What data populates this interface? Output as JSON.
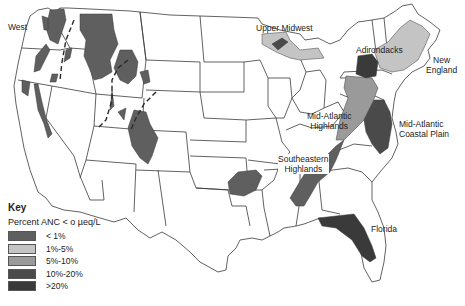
{
  "map": {
    "title": "Percent ANC < 0 µeq/L",
    "regions": [
      {
        "id": "west",
        "label": "West",
        "category": "<1%"
      },
      {
        "id": "upper-midwest",
        "label": "Upper Midwest",
        "category": "1%-5%"
      },
      {
        "id": "adirondacks",
        "label": "Adirondacks",
        "category": ">20%"
      },
      {
        "id": "new-england",
        "label": "New England",
        "lines": [
          "New",
          "England"
        ],
        "category": "1%-5%"
      },
      {
        "id": "mid-atlantic-highlands",
        "label": "Mid-Atlantic Highlands",
        "lines": [
          "Mid-Atlantic",
          "Highlands"
        ],
        "category": "5%-10%"
      },
      {
        "id": "mid-atlantic-coastal-plain",
        "label": "Mid-Atlantic Coastal Plain",
        "lines": [
          "Mid-Atlantic",
          "Coastal Plain"
        ],
        "category": "10%-20%"
      },
      {
        "id": "southeastern-highlands",
        "label": "Southeastern Highlands",
        "lines": [
          "Southeastern",
          "Highlands"
        ],
        "category": "<1%"
      },
      {
        "id": "florida",
        "label": "Florida",
        "category": ">20%"
      }
    ],
    "feature_lines": [
      "continental-divide (dashed)"
    ]
  },
  "key": {
    "title": "Key",
    "subtitle": "Percent ANC < o µeq/L",
    "items": [
      {
        "label": "< 1%",
        "color": "#5f5f5f"
      },
      {
        "label": "1%-5%",
        "color": "#c4c4c4"
      },
      {
        "label": "5%-10%",
        "color": "#9a9a9a"
      },
      {
        "label": "10%-20%",
        "color": "#4a4a4a"
      },
      {
        "label": ">20%",
        "color": "#3a3a3a"
      }
    ]
  }
}
